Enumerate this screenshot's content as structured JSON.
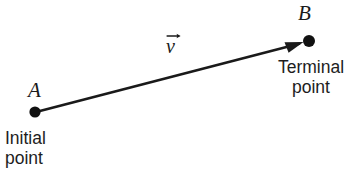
{
  "figure": {
    "type": "vector-diagram",
    "background_color": "#ffffff",
    "ink_color": "#1a1a1a"
  },
  "vector": {
    "name": "v",
    "notation": "arrow-over",
    "start": {
      "x": 35,
      "y": 112
    },
    "end": {
      "x": 309,
      "y": 41
    },
    "arrowhead": "filled-triangle",
    "line_width": 2.6
  },
  "points": {
    "initial": {
      "label": "A",
      "dot_radius": 5.6,
      "x": 35,
      "y": 112,
      "caption_line1": "Initial",
      "caption_line2": "point"
    },
    "terminal": {
      "label": "B",
      "dot_radius": 6.0,
      "x": 309,
      "y": 41,
      "caption_line1": "Terminal",
      "caption_line2": "point"
    }
  }
}
